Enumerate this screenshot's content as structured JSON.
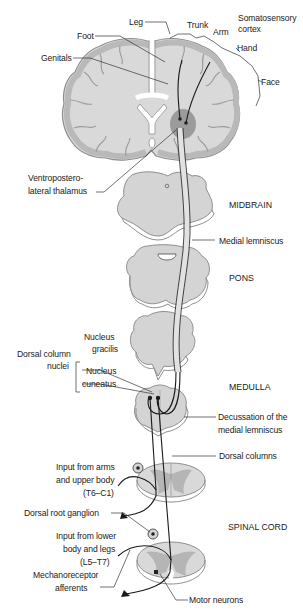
{
  "figure": {
    "colors": {
      "tissue_fill": "#d9d9d9",
      "tissue_edge": "#9a9a9a",
      "cortex_gray": "#bdbdbd",
      "thalamus_dark": "#8c8c8c",
      "tract": "#e6e6e6",
      "line": "#222222",
      "background": "#ffffff"
    },
    "labels": {
      "leg": "Leg",
      "trunk": "Trunk",
      "arm": "Arm",
      "somatosensory_1": "Somatosensory",
      "somatosensory_2": "cortex",
      "hand": "Hand",
      "foot": "Foot",
      "genitals": "Genitals",
      "face": "Face",
      "vpl_1": "Ventropostero-",
      "vpl_2": "lateral thalamus",
      "midbrain": "MIDBRAIN",
      "medial_lemniscus": "Medial lemniscus",
      "pons": "PONS",
      "nucleus_gracilis_1": "Nucleus",
      "nucleus_gracilis_2": "gracilis",
      "dorsal_column_nuclei_1": "Dorsal column",
      "dorsal_column_nuclei_2": "nuclei",
      "nucleus_cuneatus_1": "Nucleus",
      "nucleus_cuneatus_2": "cuneatus",
      "medulla": "MEDULLA",
      "decussation_1": "Decussation of the",
      "decussation_2": "medial lemniscus",
      "dorsal_columns": "Dorsal columns",
      "input_upper_1": "Input from arms",
      "input_upper_2": "and upper body",
      "input_upper_3": "(T6–C1)",
      "drg": "Dorsal root ganglion",
      "spinal_cord": "SPINAL CORD",
      "input_lower_1": "Input from lower",
      "input_lower_2": "body and legs",
      "input_lower_3": "(L5–T7)",
      "mechanoreceptor_1": "Mechanoreceptor",
      "mechanoreceptor_2": "afferents",
      "motor_neurons": "Motor neurons"
    }
  }
}
